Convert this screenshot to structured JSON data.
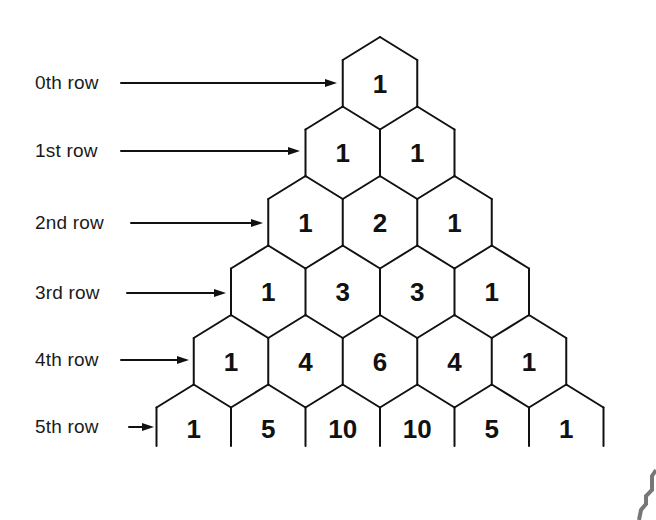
{
  "diagram": {
    "rows": [
      {
        "label": "0th row",
        "values": [
          "1"
        ]
      },
      {
        "label": "1st row",
        "values": [
          "1",
          "1"
        ]
      },
      {
        "label": "2nd row",
        "values": [
          "1",
          "2",
          "1"
        ]
      },
      {
        "label": "3rd row",
        "values": [
          "1",
          "3",
          "3",
          "1"
        ]
      },
      {
        "label": "4th row",
        "values": [
          "1",
          "4",
          "6",
          "4",
          "1"
        ]
      },
      {
        "label": "5th row",
        "values": [
          "1",
          "5",
          "10",
          "10",
          "5",
          "1"
        ]
      }
    ],
    "colors": {
      "line": "#111111",
      "text": "#1a1a1a",
      "background": "#ffffff",
      "corner_mark": "#777777"
    }
  }
}
